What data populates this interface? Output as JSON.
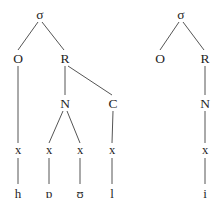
{
  "figure": {
    "type": "syllable-structure-tree-pair",
    "line_color": "#555555",
    "text_color": "#1f1f1f",
    "background_color": "#ffffff"
  },
  "trees": [
    {
      "id": "left-tree",
      "name": "syllable-tree-howl",
      "transcription": "hɒʊl",
      "nodes": [
        {
          "id": "l-sigma",
          "label": "σ",
          "tier": "syllable",
          "x": 40,
          "y": 14
        },
        {
          "id": "l-onset",
          "label": "O",
          "tier": "constituent",
          "x": 18,
          "y": 58
        },
        {
          "id": "l-rhyme",
          "label": "R",
          "tier": "constituent",
          "x": 65,
          "y": 58
        },
        {
          "id": "l-nucleus",
          "label": "N",
          "tier": "constituent",
          "x": 65,
          "y": 103
        },
        {
          "id": "l-coda",
          "label": "C",
          "tier": "constituent",
          "x": 113,
          "y": 103
        },
        {
          "id": "l-x1",
          "label": "x",
          "tier": "skeleton",
          "x": 18,
          "y": 150
        },
        {
          "id": "l-x2",
          "label": "x",
          "tier": "skeleton",
          "x": 49,
          "y": 150
        },
        {
          "id": "l-x3",
          "label": "x",
          "tier": "skeleton",
          "x": 80,
          "y": 150
        },
        {
          "id": "l-x4",
          "label": "x",
          "tier": "skeleton",
          "x": 112,
          "y": 150
        },
        {
          "id": "l-seg1",
          "label": "h",
          "tier": "segment",
          "x": 18,
          "y": 193
        },
        {
          "id": "l-seg2",
          "label": "ɒ",
          "tier": "segment",
          "x": 49,
          "y": 193
        },
        {
          "id": "l-seg3",
          "label": "ʊ",
          "tier": "segment",
          "x": 80,
          "y": 193
        },
        {
          "id": "l-seg4",
          "label": "l",
          "tier": "segment",
          "x": 112,
          "y": 193
        }
      ],
      "edges": [
        {
          "from": "l-sigma",
          "to": "l-onset",
          "x1": 38,
          "y1": 22,
          "x2": 18,
          "y2": 50
        },
        {
          "from": "l-sigma",
          "to": "l-rhyme",
          "x1": 42,
          "y1": 22,
          "x2": 64,
          "y2": 50
        },
        {
          "from": "l-onset",
          "to": "l-x1",
          "x1": 18,
          "y1": 66,
          "x2": 18,
          "y2": 143
        },
        {
          "from": "l-rhyme",
          "to": "l-nucleus",
          "x1": 65,
          "y1": 66,
          "x2": 65,
          "y2": 95
        },
        {
          "from": "l-rhyme",
          "to": "l-coda",
          "x1": 68,
          "y1": 66,
          "x2": 112,
          "y2": 95
        },
        {
          "from": "l-nucleus",
          "to": "l-x2",
          "x1": 63,
          "y1": 111,
          "x2": 49,
          "y2": 143
        },
        {
          "from": "l-nucleus",
          "to": "l-x3",
          "x1": 67,
          "y1": 111,
          "x2": 80,
          "y2": 143
        },
        {
          "from": "l-coda",
          "to": "l-x4",
          "x1": 113,
          "y1": 111,
          "x2": 112,
          "y2": 143
        },
        {
          "from": "l-x1",
          "to": "l-seg1",
          "x1": 18,
          "y1": 158,
          "x2": 18,
          "y2": 184
        },
        {
          "from": "l-x2",
          "to": "l-seg2",
          "x1": 49,
          "y1": 158,
          "x2": 49,
          "y2": 184
        },
        {
          "from": "l-x3",
          "to": "l-seg3",
          "x1": 80,
          "y1": 158,
          "x2": 80,
          "y2": 184
        },
        {
          "from": "l-x4",
          "to": "l-seg4",
          "x1": 112,
          "y1": 158,
          "x2": 112,
          "y2": 184
        }
      ]
    },
    {
      "id": "right-tree",
      "name": "syllable-tree-ee",
      "transcription": "i",
      "nodes": [
        {
          "id": "r-sigma",
          "label": "σ",
          "tier": "syllable",
          "x": 181,
          "y": 14
        },
        {
          "id": "r-onset",
          "label": "O",
          "tier": "constituent",
          "x": 160,
          "y": 58
        },
        {
          "id": "r-rhyme",
          "label": "R",
          "tier": "constituent",
          "x": 205,
          "y": 58
        },
        {
          "id": "r-nucleus",
          "label": "N",
          "tier": "constituent",
          "x": 205,
          "y": 103
        },
        {
          "id": "r-x1",
          "label": "x",
          "tier": "skeleton",
          "x": 205,
          "y": 150
        },
        {
          "id": "r-seg1",
          "label": "i",
          "tier": "segment",
          "x": 205,
          "y": 193
        }
      ],
      "edges": [
        {
          "from": "r-sigma",
          "to": "r-onset",
          "x1": 179,
          "y1": 22,
          "x2": 160,
          "y2": 50
        },
        {
          "from": "r-sigma",
          "to": "r-rhyme",
          "x1": 183,
          "y1": 22,
          "x2": 204,
          "y2": 50
        },
        {
          "from": "r-rhyme",
          "to": "r-nucleus",
          "x1": 205,
          "y1": 66,
          "x2": 205,
          "y2": 95
        },
        {
          "from": "r-nucleus",
          "to": "r-x1",
          "x1": 205,
          "y1": 111,
          "x2": 205,
          "y2": 143
        },
        {
          "from": "r-x1",
          "to": "r-seg1",
          "x1": 205,
          "y1": 158,
          "x2": 205,
          "y2": 184
        }
      ]
    }
  ]
}
